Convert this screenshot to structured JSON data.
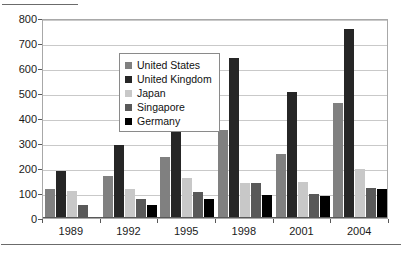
{
  "chart_data": {
    "type": "bar",
    "title": "",
    "subtitle": "",
    "xlabel": "",
    "ylabel": "",
    "categories": [
      "1989",
      "1992",
      "1995",
      "1998",
      "2001",
      "2004"
    ],
    "series": [
      {
        "name": "United States",
        "color": "#808080",
        "values": [
          115,
          168,
          243,
          353,
          256,
          460
        ]
      },
      {
        "name": "United Kingdom",
        "color": "#262626",
        "values": [
          187,
          292,
          468,
          640,
          505,
          755
        ]
      },
      {
        "name": "Japan",
        "color": "#c8c8c8",
        "values": [
          110,
          118,
          161,
          139,
          146,
          197
        ]
      },
      {
        "name": "Singapore",
        "color": "#595959",
        "values": [
          53,
          76,
          105,
          139,
          97,
          120
        ]
      },
      {
        "name": "Germany",
        "color": "#000000",
        "values": [
          3,
          54,
          77,
          93,
          89,
          116
        ]
      }
    ],
    "ylim": [
      0,
      800
    ],
    "ytick_step": 100,
    "yticks": [
      "800",
      "700",
      "600",
      "500",
      "400",
      "300",
      "200",
      "100",
      "0"
    ],
    "grid": "horizontal",
    "legend_position": "inside-upper-left",
    "plot_border_color": "#a8a8a8",
    "gridline_color": "#c9c9c9",
    "axis_color": "#585858",
    "background_color": "#ffffff"
  }
}
